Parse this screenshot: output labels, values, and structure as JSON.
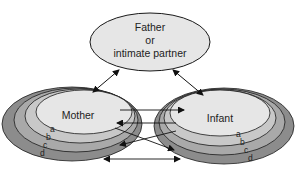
{
  "father": {
    "lines": [
      "Father",
      "or",
      "intimate partner"
    ]
  },
  "mother": {
    "label": "Mother",
    "rings": [
      "a",
      "b",
      "c",
      "d"
    ]
  },
  "infant": {
    "label": "Infant",
    "rings": [
      "a",
      "b",
      "c",
      "d"
    ]
  },
  "colors": {
    "inner_fill": "#e6e6e6",
    "ring_b": "#c8c8c8",
    "ring_c": "#a9a9a9",
    "ring_d": "#8c8c8c",
    "stroke": "#1a1a1a"
  }
}
